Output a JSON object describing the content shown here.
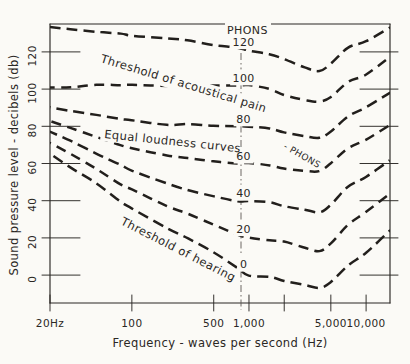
{
  "figure": {
    "title_implicit": "Equal loudness curves (Fletcher-Munson)",
    "background_color": "#fbfaf6",
    "ink_color": "#2a2724"
  },
  "axes": {
    "x": {
      "label": "Frequency - waves per second (Hz)",
      "scale": "log",
      "range": [
        20,
        16000
      ],
      "tick_labels": [
        "20Hz",
        "100",
        "500",
        "1,000",
        "5,000",
        "10,000"
      ],
      "tick_values": [
        20,
        100,
        500,
        1000,
        5000,
        10000
      ],
      "unlabeled_ticks": [
        2000
      ]
    },
    "y": {
      "label": "Sound pressure level - decibels (db)",
      "scale": "linear",
      "range": [
        -15,
        135
      ],
      "tick_labels": [
        "0",
        "20",
        "40",
        "60",
        "80",
        "100",
        "120"
      ],
      "tick_values": [
        0,
        20,
        40,
        60,
        80,
        100,
        120
      ]
    },
    "reference_line": {
      "name": "1000-hz-reference",
      "x_value": 1000,
      "style": "dash-dot",
      "orientation": "vertical"
    }
  },
  "annotations": [
    {
      "name": "threshold-of-pain-label",
      "text": "Threshold of acoustical pain",
      "rotation": 17
    },
    {
      "name": "equal-loudness-curves-label",
      "text": "Equal loudness curves",
      "rotation": 6
    },
    {
      "name": "phons-suffix-label",
      "text": "- PHONS",
      "rotation": 30
    },
    {
      "name": "threshold-of-hearing-label",
      "text": "Threshold of hearing",
      "rotation": 27
    }
  ],
  "chart_data": {
    "type": "line",
    "xlabel": "Frequency - waves per second (Hz)",
    "ylabel": "Sound pressure level - decibels (db)",
    "xscale": "log",
    "xlim": [
      20,
      16000
    ],
    "ylim": [
      -15,
      135
    ],
    "grid": false,
    "legend": "inline curve labels",
    "linestyle": "dashed",
    "x": [
      20,
      30,
      50,
      80,
      100,
      200,
      300,
      500,
      800,
      1000,
      1500,
      2000,
      3000,
      4000,
      5000,
      7000,
      10000,
      16000
    ],
    "series": [
      {
        "name": "120 PHONS",
        "label": "120",
        "label_suffix": "PHONS",
        "label_x": 900,
        "values": [
          133,
          132,
          131,
          130,
          129,
          127,
          126,
          124,
          122,
          121,
          119,
          116,
          112,
          110,
          114,
          122,
          126,
          133
        ]
      },
      {
        "name": "100 phons",
        "label": "100",
        "label_x": 900,
        "values": [
          101,
          101,
          102,
          102,
          102,
          102,
          102,
          102,
          102,
          102,
          100,
          97,
          94,
          93,
          96,
          104,
          108,
          117
        ]
      },
      {
        "name": "80 phons",
        "label": "80",
        "label_x": 900,
        "values": [
          90,
          88,
          86,
          84,
          83,
          81,
          81,
          80,
          80,
          80,
          79,
          77,
          75,
          74,
          77,
          85,
          90,
          98
        ]
      },
      {
        "name": "60 phons",
        "label": "60",
        "label_x": 900,
        "values": [
          83,
          79,
          74,
          70,
          68,
          64,
          63,
          61,
          60,
          60,
          59,
          57,
          56,
          56,
          60,
          68,
          73,
          81
        ]
      },
      {
        "name": "40 phons",
        "label": "40",
        "label_x": 900,
        "values": [
          77,
          72,
          65,
          59,
          56,
          49,
          46,
          42,
          40,
          40,
          39,
          37,
          35,
          34,
          38,
          47,
          53,
          62
        ]
      },
      {
        "name": "20 phons",
        "label": "20",
        "label_x": 900,
        "values": [
          71,
          65,
          57,
          49,
          46,
          37,
          33,
          27,
          22,
          20,
          19,
          18,
          15,
          13,
          17,
          27,
          34,
          44
        ]
      },
      {
        "name": "0 phons (threshold of hearing)",
        "label": "0",
        "label_x": 900,
        "values": [
          65,
          58,
          49,
          40,
          36,
          25,
          20,
          12,
          4,
          0,
          -1,
          -3,
          -5,
          -7,
          -4,
          5,
          12,
          24
        ]
      }
    ]
  }
}
